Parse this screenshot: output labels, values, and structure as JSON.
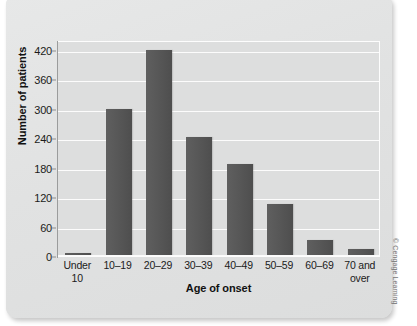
{
  "figure": {
    "credit": "© Cengage Learning",
    "panel_color": "#e2e3e3",
    "plot_bg_color": "#dddede",
    "bar_color": "#565656",
    "gridline_color": "#fcfcfc"
  },
  "chart_data": {
    "type": "bar",
    "title": "",
    "xlabel": "Age of onset",
    "ylabel": "Number of patients",
    "categories": [
      "Under 10",
      "10–19",
      "20–29",
      "30–39",
      "40–49",
      "50–59",
      "60–69",
      "70 and over"
    ],
    "category_lines": [
      [
        "Under",
        "10"
      ],
      [
        "10–19"
      ],
      [
        "20–29"
      ],
      [
        "30–39"
      ],
      [
        "40–49"
      ],
      [
        "50–59"
      ],
      [
        "60–69"
      ],
      [
        "70 and",
        "over"
      ]
    ],
    "values": [
      5,
      297,
      418,
      241,
      185,
      103,
      30,
      13
    ],
    "ylim": [
      0,
      440
    ],
    "yticks": [
      0,
      60,
      120,
      180,
      240,
      300,
      360,
      420
    ],
    "ytick_labels": [
      "0",
      "60",
      "120",
      "180",
      "240",
      "300",
      "360",
      "420"
    ],
    "grid": true,
    "legend": "none"
  }
}
